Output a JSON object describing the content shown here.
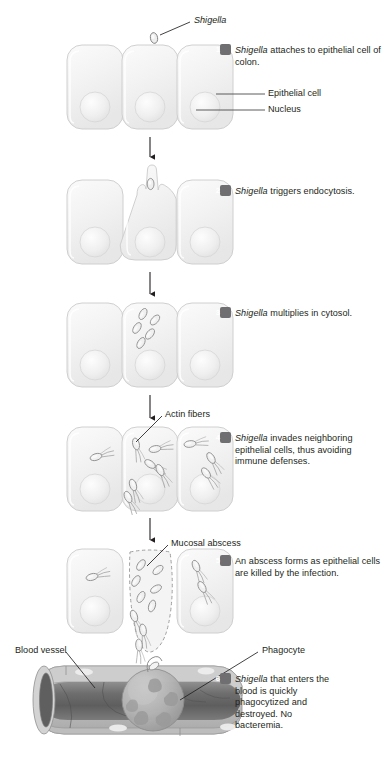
{
  "figure": {
    "type": "biological-process-diagram",
    "background_color": "#ffffff",
    "ink_color": "#231f20",
    "badge_color": "#6f6f71",
    "cell_fill": "#f2f2f2",
    "cell_stroke": "#c9c9c9",
    "nucleus_fill": "#ebebeb",
    "vessel_dark": "#6b6b6b",
    "vessel_wall": "#c5c5c5"
  },
  "callouts": {
    "shigella": "Shigella",
    "epithelial_cell": "Epithelial cell",
    "nucleus": "Nucleus",
    "actin_fibers": "Actin fibers",
    "mucosal_abscess": "Mucosal abscess",
    "blood_vessel": "Blood vessel",
    "phagocyte": "Phagocyte"
  },
  "steps": [
    {
      "number": "1",
      "italic_lead": "Shigella",
      "text": " attaches to epithelial cell of colon."
    },
    {
      "number": "2",
      "italic_lead": "Shigella",
      "text": " triggers endocytosis."
    },
    {
      "number": "3",
      "italic_lead": "Shigella",
      "text": " multiplies in cytosol."
    },
    {
      "number": "4",
      "italic_lead": "Shigella",
      "text": " invades neighboring epithelial cells, thus avoiding immune defenses."
    },
    {
      "number": "5",
      "italic_lead": "",
      "text": "An abscess forms as epithelial cells are killed by the infection."
    },
    {
      "number": "6",
      "italic_lead": "Shigella",
      "text": " that enters the blood is quickly phagocytized and destroyed. No bacteremia."
    }
  ]
}
